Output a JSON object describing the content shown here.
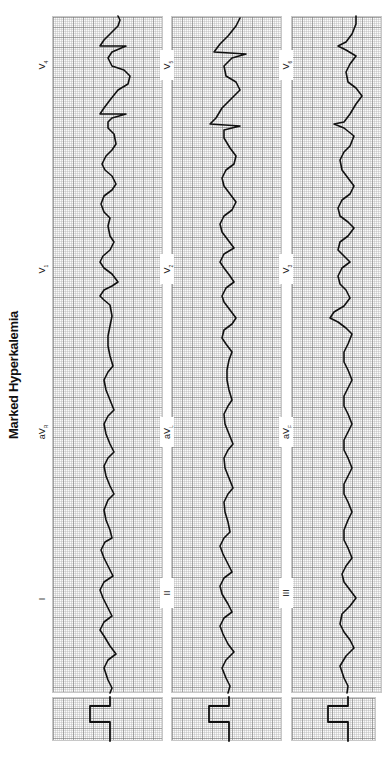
{
  "title": "Marked Hyperkalemia",
  "orientation": "rotated 90° counter-clockwise",
  "rows": [
    {
      "leads": [
        {
          "name": "I",
          "sub": ""
        },
        {
          "name": "aV",
          "sub": "R"
        },
        {
          "name": "V",
          "sub": "1"
        },
        {
          "name": "V",
          "sub": "4"
        }
      ]
    },
    {
      "leads": [
        {
          "name": "II",
          "sub": ""
        },
        {
          "name": "aV",
          "sub": "L"
        },
        {
          "name": "V",
          "sub": "2"
        },
        {
          "name": "V",
          "sub": "5"
        }
      ]
    },
    {
      "leads": [
        {
          "name": "III",
          "sub": ""
        },
        {
          "name": "aV",
          "sub": "F"
        },
        {
          "name": "V",
          "sub": "3"
        },
        {
          "name": "V",
          "sub": "6"
        }
      ]
    }
  ],
  "calibration": {
    "count": 3,
    "shape": "square pulse"
  },
  "colors": {
    "grid": "#aaaaaa",
    "trace": "#111111",
    "background": "#ffffff"
  }
}
